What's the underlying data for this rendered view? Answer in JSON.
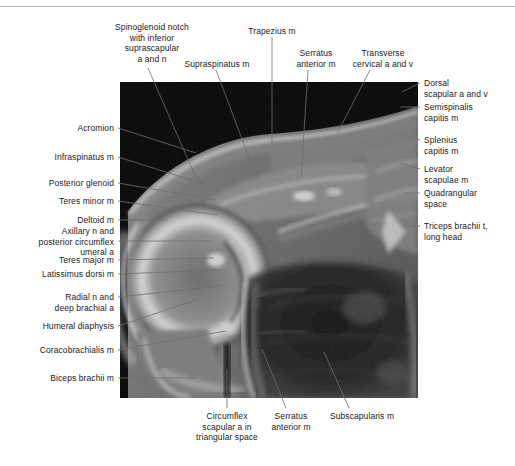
{
  "figure": {
    "kind": "anatomical-mri-figure",
    "image_alt": "Axial MRI of the shoulder girdle",
    "background_color": "#ffffff",
    "rule_color": "#b4b4b4",
    "leader_color": "#6e6e6e",
    "image_region": {
      "left": 120,
      "top": 82,
      "width": 298,
      "height": 316
    }
  },
  "labels": {
    "top": [
      {
        "name": "spinoglenoid-notch",
        "text": "Spinoglenoid notch\nwith inferior\nsuprascapular\na and n",
        "x": 92,
        "y": 22,
        "width": 120,
        "align": "center",
        "leader": {
          "x1": 148,
          "y1": 68,
          "x2": 196,
          "y2": 178
        }
      },
      {
        "name": "supraspinatus",
        "text": "Supraspinatus m",
        "x": 172,
        "y": 59,
        "width": 90,
        "align": "center",
        "leader": {
          "x1": 216,
          "y1": 70,
          "x2": 251,
          "y2": 163
        }
      },
      {
        "name": "trapezius",
        "text": "Trapezius m",
        "x": 237,
        "y": 26,
        "width": 70,
        "align": "center",
        "leader": {
          "x1": 272,
          "y1": 37,
          "x2": 272,
          "y2": 143
        }
      },
      {
        "name": "serratus-anterior-top",
        "text": "Serratus\nanterior m",
        "x": 286,
        "y": 48,
        "width": 60,
        "align": "center",
        "leader": {
          "x1": 308,
          "y1": 70,
          "x2": 301,
          "y2": 178
        }
      },
      {
        "name": "transverse-cervical-vessels",
        "text": "Transverse\ncervical a and v",
        "x": 340,
        "y": 48,
        "width": 86,
        "align": "center",
        "leader": {
          "x1": 370,
          "y1": 70,
          "x2": 338,
          "y2": 132
        }
      }
    ],
    "right": [
      {
        "name": "dorsal-scapular-vessels",
        "text": "Dorsal\nscapular a and v",
        "x": 424,
        "y": 78,
        "width": 88,
        "align": "left",
        "leader": {
          "x1": 420,
          "y1": 83,
          "x2": 402,
          "y2": 92
        }
      },
      {
        "name": "semispinalis-capitis",
        "text": "Semispinalis\ncapitis m",
        "x": 424,
        "y": 102,
        "width": 88,
        "align": "left",
        "leader": {
          "x1": 420,
          "y1": 107,
          "x2": 400,
          "y2": 107
        }
      },
      {
        "name": "splenius-capitis",
        "text": "Splenius\ncapitis m",
        "x": 424,
        "y": 135,
        "width": 88,
        "align": "left",
        "leader": {
          "x1": 420,
          "y1": 140,
          "x2": 400,
          "y2": 134
        }
      },
      {
        "name": "levator-scapulae",
        "text": "Levator\nscapulae m",
        "x": 424,
        "y": 164,
        "width": 88,
        "align": "left",
        "leader": {
          "x1": 420,
          "y1": 169,
          "x2": 400,
          "y2": 163
        }
      },
      {
        "name": "quadrangular-space",
        "text": "Quadrangular\nspace",
        "x": 424,
        "y": 188,
        "width": 88,
        "align": "left",
        "leader": {
          "x1": 420,
          "y1": 193,
          "x2": 404,
          "y2": 193
        }
      },
      {
        "name": "triceps-brachii-long-head",
        "text": "Triceps brachii t,\nlong head",
        "x": 424,
        "y": 221,
        "width": 90,
        "align": "left",
        "leader": {
          "x1": 420,
          "y1": 226,
          "x2": 404,
          "y2": 226
        }
      }
    ],
    "left": [
      {
        "name": "acromion",
        "text": "Acromion",
        "x": 10,
        "y": 123,
        "width": 104,
        "align": "right",
        "leader": {
          "x1": 118,
          "y1": 128,
          "x2": 196,
          "y2": 153
        }
      },
      {
        "name": "infraspinatus",
        "text": "Infraspinatus m",
        "x": 10,
        "y": 152,
        "width": 104,
        "align": "right",
        "leader": {
          "x1": 118,
          "y1": 157,
          "x2": 204,
          "y2": 184
        }
      },
      {
        "name": "posterior-glenoid",
        "text": "Posterior glenoid",
        "x": 10,
        "y": 178,
        "width": 104,
        "align": "right",
        "leader": {
          "x1": 118,
          "y1": 183,
          "x2": 216,
          "y2": 200
        }
      },
      {
        "name": "teres-minor",
        "text": "Teres minor m",
        "x": 10,
        "y": 196,
        "width": 104,
        "align": "right",
        "leader": {
          "x1": 118,
          "y1": 201,
          "x2": 218,
          "y2": 215
        }
      },
      {
        "name": "deltoid",
        "text": "Deltoid m",
        "x": 10,
        "y": 215,
        "width": 104,
        "align": "right",
        "leader": {
          "x1": 118,
          "y1": 220,
          "x2": 168,
          "y2": 220
        }
      },
      {
        "name": "axillary-nerve-circumflex",
        "text": "Axillary n and\nposterior circumflex\numeral a",
        "x": 10,
        "y": 226,
        "width": 104,
        "align": "right",
        "leader": {
          "x1": 118,
          "y1": 241,
          "x2": 212,
          "y2": 241
        }
      },
      {
        "name": "teres-major",
        "text": "Teres major m",
        "x": 10,
        "y": 255,
        "width": 104,
        "align": "right",
        "leader": {
          "x1": 118,
          "y1": 260,
          "x2": 214,
          "y2": 258
        }
      },
      {
        "name": "latissimus-dorsi",
        "text": "Latissimus dorsi m",
        "x": 10,
        "y": 269,
        "width": 104,
        "align": "right",
        "leader": {
          "x1": 118,
          "y1": 274,
          "x2": 216,
          "y2": 270
        }
      },
      {
        "name": "radial-nerve-deep-brachial",
        "text": "Radial n and\ndeep brachial a",
        "x": 10,
        "y": 292,
        "width": 104,
        "align": "right",
        "leader": {
          "x1": 118,
          "y1": 297,
          "x2": 222,
          "y2": 286
        }
      },
      {
        "name": "humeral-diaphysis",
        "text": "Humeral diaphysis",
        "x": 10,
        "y": 321,
        "width": 104,
        "align": "right",
        "leader": {
          "x1": 118,
          "y1": 326,
          "x2": 196,
          "y2": 300
        }
      },
      {
        "name": "coracobrachialis",
        "text": "Coracobrachialis m",
        "x": 10,
        "y": 345,
        "width": 104,
        "align": "right",
        "leader": {
          "x1": 118,
          "y1": 350,
          "x2": 226,
          "y2": 331
        }
      },
      {
        "name": "biceps-brachii",
        "text": "Biceps brachii m",
        "x": 10,
        "y": 373,
        "width": 104,
        "align": "right",
        "leader": {
          "x1": 118,
          "y1": 378,
          "x2": 196,
          "y2": 378
        }
      }
    ],
    "bottom": [
      {
        "name": "circumflex-scapular-artery",
        "text": "Circumflex\nscapular a in\ntriangular space",
        "x": 186,
        "y": 411,
        "width": 82,
        "align": "center",
        "leader": {
          "x1": 227,
          "y1": 408,
          "x2": 227,
          "y2": 369
        }
      },
      {
        "name": "serratus-anterior-bottom",
        "text": "Serratus\nanterior m",
        "x": 258,
        "y": 411,
        "width": 66,
        "align": "center",
        "leader": {
          "x1": 286,
          "y1": 408,
          "x2": 262,
          "y2": 349
        }
      },
      {
        "name": "subscapularis",
        "text": "Subscapularis m",
        "x": 316,
        "y": 411,
        "width": 92,
        "align": "center",
        "leader": {
          "x1": 349,
          "y1": 408,
          "x2": 324,
          "y2": 352
        }
      }
    ]
  }
}
